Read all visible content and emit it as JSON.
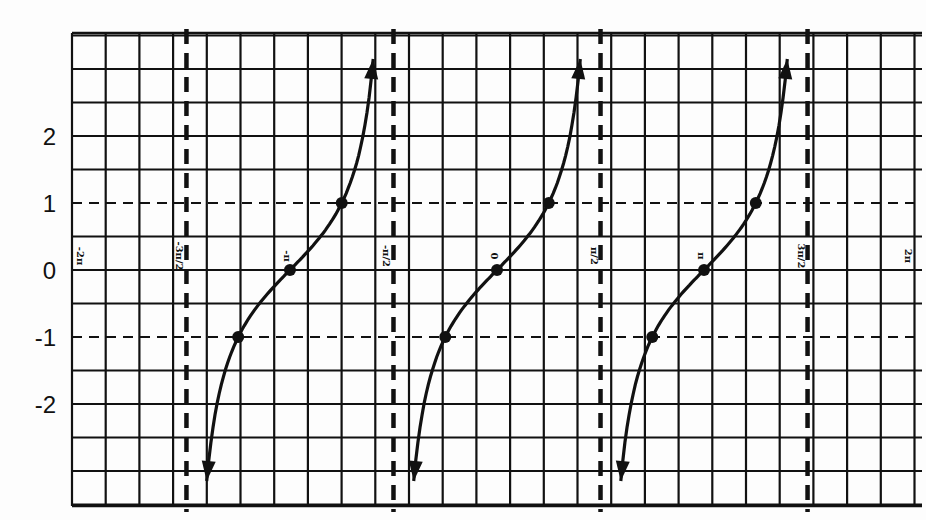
{
  "chart_data": {
    "type": "line",
    "title": "",
    "function": "y = tan(x)",
    "xlabel": "",
    "ylabel": "",
    "xlim": [
      -6.2832,
      6.2832
    ],
    "ylim": [
      -3.5,
      3.5
    ],
    "grid": true,
    "legend": null,
    "x_tick_labels": [
      "-2π",
      "-3π/2",
      "-π",
      "-π/2",
      "0",
      "π/2",
      "π",
      "3π/2",
      "2π"
    ],
    "x_tick_values": [
      -6.2832,
      -4.7124,
      -3.1416,
      -1.5708,
      0,
      1.5708,
      3.1416,
      4.7124,
      6.2832
    ],
    "y_tick_labels": [
      "2",
      "1",
      "0",
      "-1",
      "-2"
    ],
    "y_tick_values": [
      2,
      1,
      0,
      -1,
      -2
    ],
    "reference_lines": {
      "horizontal_dashed": [
        1,
        -1
      ],
      "vertical_asymptotes": [
        -4.7124,
        -1.5708,
        1.5708,
        4.7124
      ],
      "asymptote_labels": [
        "-3π/2",
        "-π/2",
        "π/2",
        "3π/2"
      ]
    },
    "series": [
      {
        "name": "tan(x) branch 1",
        "domain": [
          -4.7124,
          -1.5708
        ],
        "points": [
          {
            "x": -3.927,
            "y": -1,
            "label": "(-5π/4, -1)"
          },
          {
            "x": -3.1416,
            "y": 0,
            "label": "(-π, 0)"
          },
          {
            "x": -2.3562,
            "y": 1,
            "label": "(-3π/4, 1)"
          }
        ]
      },
      {
        "name": "tan(x) branch 2",
        "domain": [
          -1.5708,
          1.5708
        ],
        "points": [
          {
            "x": -0.7854,
            "y": -1,
            "label": "(-π/4, -1)"
          },
          {
            "x": 0,
            "y": 0,
            "label": "(0, 0)"
          },
          {
            "x": 0.7854,
            "y": 1,
            "label": "(π/4, 1)"
          }
        ]
      },
      {
        "name": "tan(x) branch 3",
        "domain": [
          1.5708,
          4.7124
        ],
        "points": [
          {
            "x": 2.3562,
            "y": -1,
            "label": "(3π/4, -1)"
          },
          {
            "x": 3.1416,
            "y": 0,
            "label": "(π, 0)"
          },
          {
            "x": 3.927,
            "y": 1,
            "label": "(5π/4, 1)"
          }
        ]
      }
    ]
  },
  "layout": {
    "grid": {
      "left": 72,
      "top": 33,
      "right": 922,
      "bottom": 506,
      "cell": 33.7
    },
    "origin_px": {
      "x": 497,
      "y": 270
    },
    "px_per_radian": 65.9,
    "px_per_unit_y": 67,
    "colors": {
      "ink": "#111111",
      "paper": "#fdfdfd"
    }
  }
}
